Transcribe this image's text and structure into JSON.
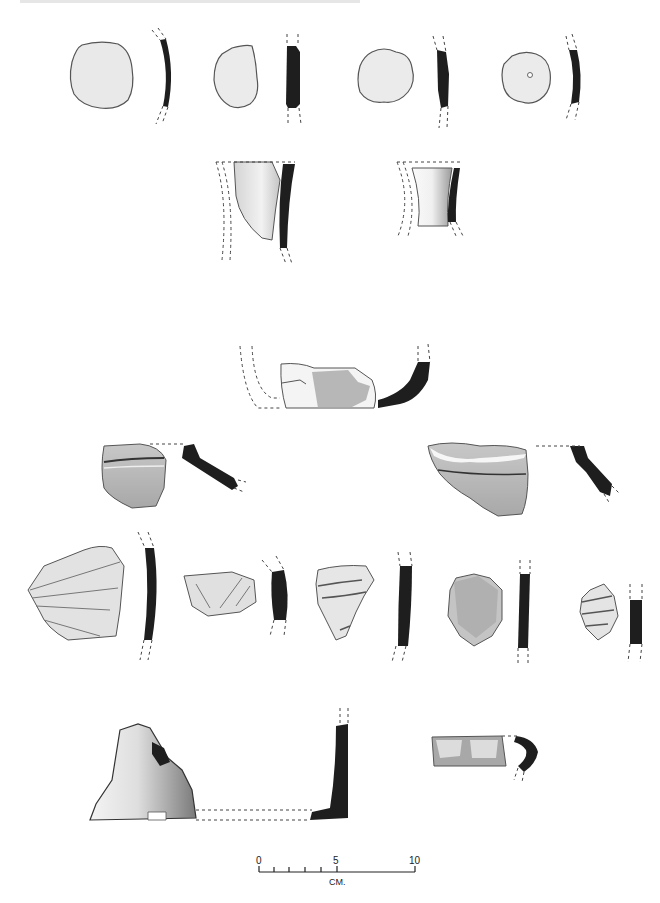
{
  "figure": {
    "type": "archaeological pottery sherd illustration",
    "rows": [
      {
        "row": 1,
        "sherds": [
          "body-sherd-1",
          "body-sherd-2",
          "body-sherd-3",
          "body-sherd-4-perforated"
        ]
      },
      {
        "row": 2,
        "sherds": [
          "neck-sherd-1",
          "neck-sherd-2"
        ]
      },
      {
        "row": 3,
        "sherds": [
          "base-sherd-1"
        ]
      },
      {
        "row": 4,
        "sherds": [
          "rim-sherd-1",
          "rim-sherd-2"
        ]
      },
      {
        "row": 5,
        "sherds": [
          "incised-sherd-1",
          "incised-sherd-2",
          "incised-sherd-3",
          "body-sherd-5",
          "incised-sherd-4"
        ]
      },
      {
        "row": 6,
        "sherds": [
          "base-sherd-2",
          "handle-rim-sherd"
        ]
      }
    ]
  },
  "scale_bar": {
    "labels": [
      "0",
      "5",
      "10"
    ],
    "unit": "CM."
  },
  "colors": {
    "profile": "#1e1e1e",
    "outline": "#555555",
    "fill_light": "#e8e8e8",
    "fill_mid": "#bdbdbd"
  }
}
